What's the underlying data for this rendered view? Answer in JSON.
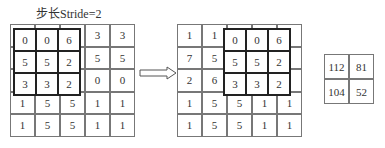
{
  "title": "步长Stride=2",
  "left_grid": {
    "cells": [
      [
        "0",
        "0",
        "6",
        "3",
        "3"
      ],
      [
        "5",
        "5",
        "2",
        "5",
        "5"
      ],
      [
        "3",
        "3",
        "2",
        "0",
        "0"
      ],
      [
        "1",
        "5",
        "5",
        "1",
        "1"
      ],
      [
        "1",
        "5",
        "5",
        "1",
        "1"
      ]
    ]
  },
  "left_kernel": {
    "cells": [
      [
        "0",
        "0",
        "6"
      ],
      [
        "5",
        "5",
        "2"
      ],
      [
        "3",
        "3",
        "2"
      ]
    ]
  },
  "right_grid": {
    "cells": [
      [
        "1",
        "1",
        "",
        "",
        ""
      ],
      [
        "7",
        "5",
        "",
        "",
        ""
      ],
      [
        "2",
        "6",
        "",
        "",
        ""
      ],
      [
        "1",
        "5",
        "5",
        "1",
        "1"
      ],
      [
        "1",
        "5",
        "5",
        "1",
        "1"
      ]
    ]
  },
  "right_kernel": {
    "cells": [
      [
        "0",
        "0",
        "6"
      ],
      [
        "5",
        "5",
        "2"
      ],
      [
        "3",
        "3",
        "2"
      ]
    ]
  },
  "result": {
    "cells": [
      [
        "112",
        "81"
      ],
      [
        "104",
        "52"
      ]
    ]
  },
  "arrow_icon": "double-right-arrow-icon"
}
